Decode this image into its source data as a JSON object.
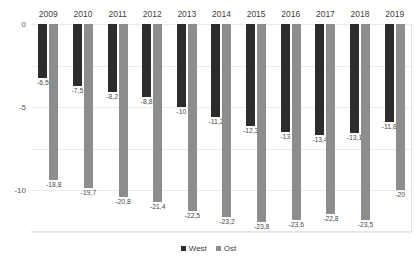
{
  "title_clipped": "",
  "legend": {
    "position": "bottom",
    "entries": [
      {
        "label": "West",
        "color": "#2c2c2c"
      },
      {
        "label": "Ost",
        "color": "#8d8d8d"
      }
    ]
  },
  "axis": {
    "y_ticks": [
      "0",
      "-5",
      "-10",
      "-15",
      "-20",
      "-25"
    ],
    "y_tick_values": [
      0,
      -5,
      -10,
      -15,
      -20,
      -25
    ]
  },
  "chart_data": {
    "type": "bar",
    "title": "",
    "subtitle": "",
    "xlabel": "",
    "ylabel": "",
    "ylim": [
      -25,
      0
    ],
    "grid": true,
    "legend_position": "bottom",
    "categories": [
      "2009",
      "2010",
      "2011",
      "2012",
      "2013",
      "2014",
      "2015",
      "2016",
      "2017",
      "2018",
      "2019"
    ],
    "series": [
      {
        "name": "West",
        "color": "#2c2c2c",
        "values": [
          -6.5,
          -7.5,
          -8.2,
          -8.8,
          -10,
          -11.2,
          -12.3,
          -13,
          -13.4,
          -13.1,
          -11.8
        ],
        "labels": [
          "-6,5",
          "-7,5",
          "-8,2",
          "-8,8",
          "-10",
          "-11,2",
          "-12,3",
          "-13",
          "-13,4",
          "-13,1",
          "-11,8"
        ]
      },
      {
        "name": "Ost",
        "color": "#8d8d8d",
        "values": [
          -18.8,
          -19.7,
          -20.8,
          -21.4,
          -22.5,
          -23.2,
          -23.8,
          -23.6,
          -22.8,
          -23.5,
          -20
        ],
        "labels": [
          "-18,8",
          "-19,7",
          "-20,8",
          "-21,4",
          "-22,5",
          "-23,2",
          "-23,8",
          "-23,6",
          "-22,8",
          "-23,5",
          "-20"
        ]
      }
    ]
  }
}
